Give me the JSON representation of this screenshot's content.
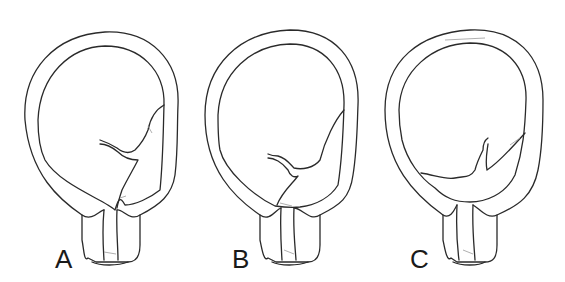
{
  "figure": {
    "panels": [
      {
        "id": "A",
        "label": "A",
        "description": "uterus-cross-section-early-separation"
      },
      {
        "id": "B",
        "label": "B",
        "description": "uterus-cross-section-partial-separation"
      },
      {
        "id": "C",
        "label": "C",
        "description": "uterus-cross-section-complete-separation"
      }
    ],
    "colors": {
      "line": "#2a2a2a",
      "background": "#ffffff",
      "shading": "#9a9a9a"
    }
  }
}
